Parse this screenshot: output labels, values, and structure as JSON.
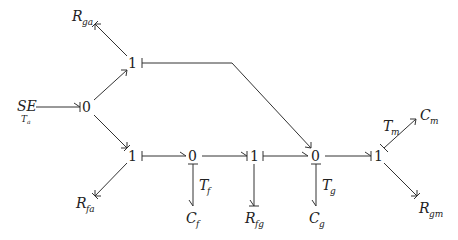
{
  "diagram": {
    "type": "bond-graph",
    "nodes": {
      "se": {
        "main": "SE",
        "sub": "T",
        "subsub": "a"
      },
      "j0_source": {
        "label": "0"
      },
      "j1_top": {
        "label": "1"
      },
      "j1_bottom": {
        "label": "1"
      },
      "j0_f": {
        "label": "0"
      },
      "j1_fg": {
        "label": "1"
      },
      "j0_g": {
        "label": "0"
      },
      "j1_m": {
        "label": "1"
      },
      "r_ga": {
        "main": "R",
        "sub": "ga"
      },
      "r_fa": {
        "main": "R",
        "sub": "fa"
      },
      "c_f": {
        "main": "C",
        "sub": "f"
      },
      "t_f": {
        "main": "T",
        "sub": "f"
      },
      "r_fg": {
        "main": "R",
        "sub": "fg"
      },
      "c_g": {
        "main": "C",
        "sub": "g"
      },
      "t_g": {
        "main": "T",
        "sub": "g"
      },
      "c_m": {
        "main": "C",
        "sub": "m"
      },
      "t_m": {
        "main": "T",
        "sub": "m"
      },
      "r_gm": {
        "main": "R",
        "sub": "gm"
      }
    },
    "bonds": [
      {
        "from": "SE",
        "to": "0"
      },
      {
        "from": "0",
        "to": "1 (top)"
      },
      {
        "from": "0",
        "to": "1 (bottom)"
      },
      {
        "from": "1 (top)",
        "to": "R_ga"
      },
      {
        "from": "1 (top)",
        "to": "0 (T_g)"
      },
      {
        "from": "1 (bottom)",
        "to": "R_fa"
      },
      {
        "from": "1 (bottom)",
        "to": "0 (T_f)"
      },
      {
        "from": "0 (T_f)",
        "to": "C_f"
      },
      {
        "from": "0 (T_f)",
        "to": "1 (R_fg)"
      },
      {
        "from": "1 (R_fg)",
        "to": "R_fg"
      },
      {
        "from": "1 (R_fg)",
        "to": "0 (T_g)"
      },
      {
        "from": "0 (T_g)",
        "to": "C_g"
      },
      {
        "from": "0 (T_g)",
        "to": "1 (right)"
      },
      {
        "from": "1 (right)",
        "to": "C_m"
      },
      {
        "from": "1 (right)",
        "to": "R_gm"
      }
    ]
  }
}
